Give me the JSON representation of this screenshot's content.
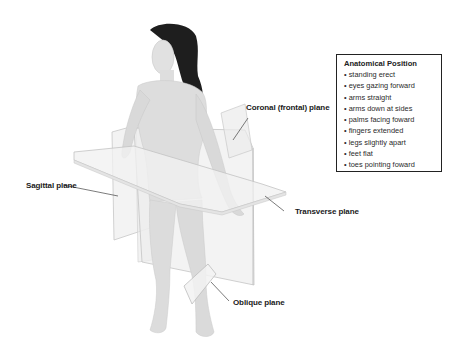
{
  "labels": {
    "coronal": "Coronal (frontal) plane",
    "sagittal": "Sagittal plane",
    "transverse": "Transverse plane",
    "oblique": "Oblique plane"
  },
  "info_box": {
    "title": "Anatomical Position",
    "items": [
      "standing erect",
      "eyes gazing forward",
      "arms straight",
      "arms down at sides",
      "palms facing foward",
      "fingers extended",
      "legs slightly apart",
      "feet flat",
      "toes pointing foward"
    ]
  },
  "colors": {
    "background": "#ffffff",
    "plane_fill": "#ececec",
    "plane_edge": "#c4c4c4",
    "skin": "#dcdcdc",
    "hair": "#1e1e1e",
    "text": "#1a1a1a"
  }
}
